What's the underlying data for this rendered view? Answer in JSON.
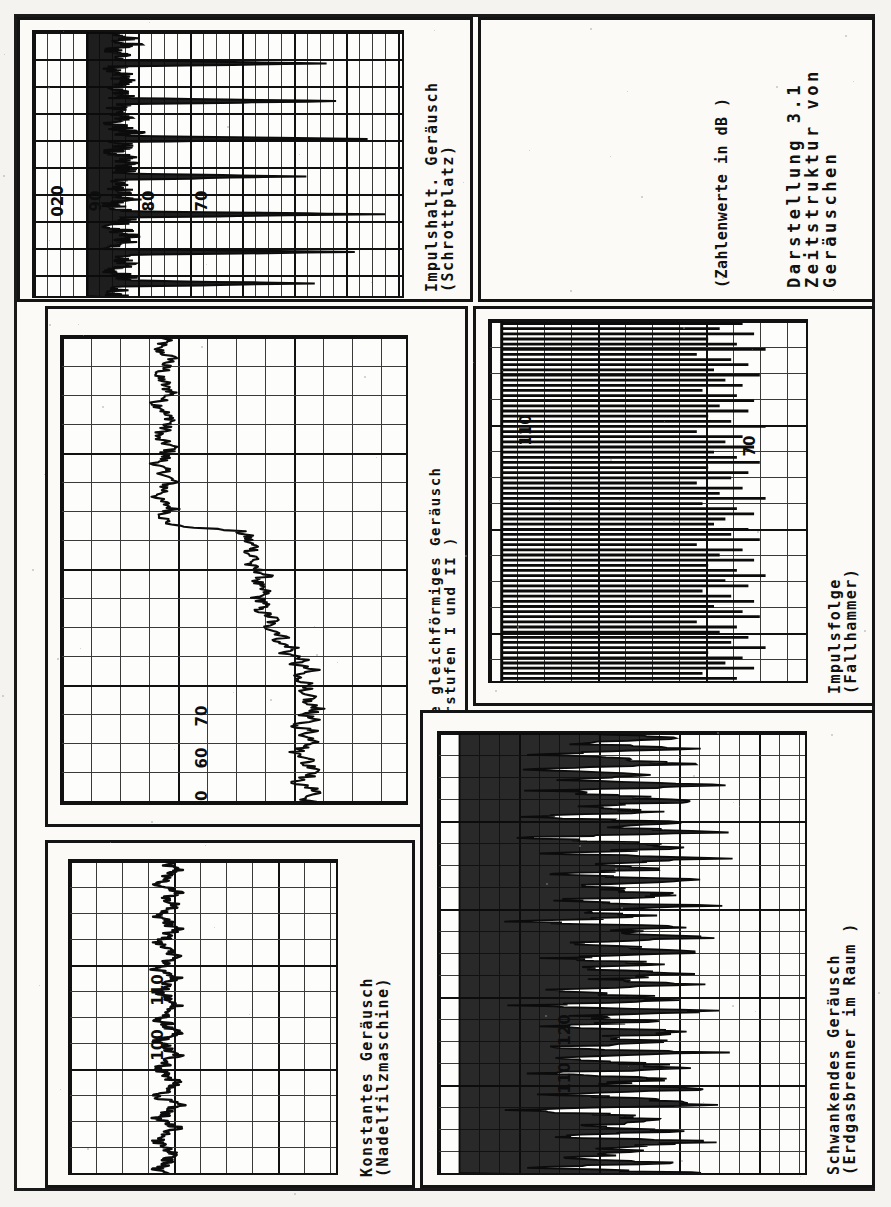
{
  "document": {
    "kind": "scanned-figure-page",
    "orientation": "rotated-90-ccw",
    "page_title": "Darstellung 3.1 — Zeitstruktur von Geräuschen"
  },
  "caption_panel": {
    "name": "figure-caption",
    "line1": "Darstellung   3.1",
    "line2": "Zeitstruktur von",
    "line3": "Geräuschen",
    "line4": "(Zahlenwerte in dB )"
  },
  "panels": [
    {
      "id": "impulshaltiges",
      "title": "Impulshalt. Geräusch",
      "subtitle": "(Schrottplatz)",
      "axis_labels": [
        "020",
        "90",
        "80",
        "70"
      ]
    },
    {
      "id": "stufenweise",
      "title": "Stufenweise gleichförmiges Geräusch",
      "subtitle": "(Ventilatorstufen I und II )",
      "axis_labels": [
        "70",
        "60",
        "50"
      ]
    },
    {
      "id": "konstantes",
      "title": "Konstantes Geräusch",
      "subtitle": "(Nadelfilzmaschine)",
      "axis_labels": [
        "110",
        "100"
      ]
    },
    {
      "id": "impulsfolge",
      "title": "Impulsfolge",
      "subtitle": "(Fallhammer)",
      "axis_labels": [
        "110",
        "70"
      ]
    },
    {
      "id": "schwankendes",
      "title": "Schwankendes Geräusch",
      "subtitle": "(Erdgasbrenner  im Raum )",
      "axis_labels": [
        "120",
        "110"
      ]
    }
  ],
  "chart_data": [
    {
      "type": "line",
      "id": "impulshaltiges",
      "title": "Impulshalt. Geräusch",
      "subtitle": "(Schrottplatz)",
      "xlabel": "Zeit",
      "ylabel": "Schalldruckpegel (dB)",
      "ytick_labels": [
        "020",
        "90",
        "80",
        "70"
      ],
      "ylim": [
        60,
        105
      ],
      "grid": true,
      "description": "Impulsive noise from a scrapyard: a low baseline near 70 dB interrupted by seven tall narrow impulse spikes reaching 95-103 dB.",
      "values": [
        70,
        69,
        71,
        70,
        72,
        70,
        69,
        71,
        70,
        71,
        96,
        70,
        69,
        70,
        71,
        70,
        72,
        70,
        69,
        70,
        71,
        70,
        97,
        71,
        70,
        69,
        70,
        71,
        70,
        69,
        71,
        70,
        72,
        70,
        101,
        70,
        71,
        70,
        69,
        70,
        71,
        70,
        72,
        70,
        71,
        70,
        93,
        70,
        71,
        69,
        70,
        71,
        70,
        72,
        70,
        69,
        70,
        71,
        103,
        70,
        71,
        70,
        69,
        71,
        70,
        72,
        70,
        71,
        70,
        69,
        99,
        70,
        71,
        70,
        72,
        70,
        69,
        70,
        71,
        70,
        95,
        71,
        70,
        69,
        70
      ]
    },
    {
      "type": "line",
      "id": "stufenweise",
      "title": "Stufenweise gleichförmiges Geräusch",
      "subtitle": "(Ventilatorstufen I und II )",
      "xlabel": "Zeit",
      "ylabel": "Schalldruckpegel (dB)",
      "ytick_labels": [
        "70",
        "60",
        "50"
      ],
      "ylim": [
        45,
        80
      ],
      "grid": true,
      "description": "Step-wise steady noise: a stable low level near 55 dB (fan stage I) which steps up to a fluctuating higher level of about 67-72 dB (fan stage II).",
      "values": [
        55,
        55,
        54,
        55,
        56,
        55,
        55,
        54,
        55,
        55,
        56,
        55,
        54,
        55,
        55,
        56,
        55,
        55,
        54,
        55,
        56,
        55,
        55,
        54,
        55,
        55,
        56,
        55,
        55,
        54,
        55,
        56,
        55,
        55,
        56,
        63,
        64,
        64,
        65,
        64,
        65,
        64,
        65,
        66,
        65,
        65,
        66,
        65,
        66,
        65,
        66,
        67,
        66,
        67,
        68,
        67,
        69,
        68,
        70,
        69,
        71,
        69,
        70,
        71,
        69,
        71,
        70,
        72,
        70,
        71,
        69,
        71,
        70,
        72,
        70,
        69,
        71,
        70,
        72,
        71,
        69,
        70,
        72,
        70,
        71
      ]
    },
    {
      "type": "line",
      "id": "konstantes",
      "title": "Konstantes Geräusch",
      "subtitle": "(Nadelfilzmaschine)",
      "xlabel": "Zeit",
      "ylabel": "Schalldruckpegel (dB)",
      "ytick_labels": [
        "110",
        "100"
      ],
      "ylim": [
        95,
        115
      ],
      "grid": true,
      "description": "Constant noise from a needle-felt machine: an essentially flat trace hovering around 101-103 dB with only very small ripples.",
      "values": [
        102,
        102,
        103,
        102,
        102,
        101,
        102,
        103,
        102,
        102,
        103,
        102,
        101,
        102,
        102,
        103,
        102,
        102,
        101,
        102,
        102,
        103,
        102,
        102,
        101,
        102,
        103,
        102,
        102,
        101,
        102,
        102,
        103,
        102,
        102,
        101,
        102,
        102,
        103,
        102,
        101,
        102,
        102,
        103,
        102,
        102,
        101,
        102,
        102,
        103,
        102,
        102,
        101,
        102,
        103,
        102,
        102,
        101,
        102,
        103,
        102,
        102,
        101,
        102,
        102,
        103,
        102,
        102,
        101,
        102
      ]
    },
    {
      "type": "bar",
      "id": "impulsfolge",
      "title": "Impulsfolge",
      "subtitle": "(Fallhammer)",
      "xlabel": "Zeit",
      "ylabel": "Schalldruckpegel (dB)",
      "ytick_labels": [
        "110",
        "70"
      ],
      "ylim": [
        65,
        118
      ],
      "grid": true,
      "description": "Regular impulse sequence from a drop hammer: a dense train of roughly equal-height impulses between about 95 and 112 dB returning to a 70 dB floor between blows.",
      "values": [
        108,
        104,
        110,
        102,
        107,
        112,
        100,
        106,
        109,
        103,
        111,
        105,
        108,
        101,
        107,
        110,
        104,
        109,
        102,
        106,
        112,
        100,
        108,
        105,
        110,
        103,
        107,
        111,
        102,
        109,
        106,
        100,
        108,
        104,
        112,
        101,
        107,
        110,
        105,
        103,
        109,
        106,
        111,
        100,
        108,
        104,
        110,
        102,
        107,
        112,
        105,
        109,
        101,
        106,
        110,
        103,
        108,
        111,
        100,
        107,
        104,
        109,
        106,
        112,
        102,
        108,
        105,
        110,
        101,
        107
      ]
    },
    {
      "type": "line",
      "id": "schwankendes",
      "title": "Schwankendes Geräusch",
      "subtitle": "(Erdgasbrenner  im Raum )",
      "xlabel": "Zeit",
      "ylabel": "Schalldruckpegel (dB)",
      "ytick_labels": [
        "120",
        "110"
      ],
      "ylim": [
        100,
        128
      ],
      "grid": true,
      "description": "Fluctuating noise of a natural-gas burner in a room: a strongly and irregularly varying trace swinging roughly between 106 and 122 dB.",
      "values": [
        112,
        118,
        109,
        121,
        107,
        115,
        119,
        106,
        117,
        110,
        122,
        108,
        114,
        120,
        111,
        116,
        107,
        119,
        113,
        121,
        106,
        115,
        118,
        109,
        122,
        110,
        117,
        108,
        120,
        112,
        114,
        119,
        107,
        121,
        111,
        116,
        106,
        118,
        113,
        122,
        109,
        115,
        120,
        108,
        117,
        110,
        119,
        112,
        121,
        107,
        114,
        118,
        106,
        122,
        111,
        116,
        109,
        120,
        113,
        117,
        108,
        121,
        110,
        115,
        119,
        107,
        118,
        112,
        122,
        109,
        116,
        120,
        106,
        114,
        117,
        111,
        119,
        108,
        121,
        113,
        115,
        110,
        118,
        107,
        120
      ]
    }
  ]
}
